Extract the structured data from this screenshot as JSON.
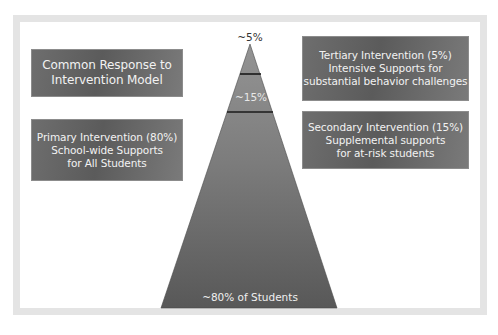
{
  "diagram": {
    "title_box": {
      "lines": [
        "Common Response to",
        "Intervention Model"
      ]
    },
    "primary_box": {
      "lines": [
        "Primary Intervention (80%)",
        "School-wide Supports",
        "for All Students"
      ]
    },
    "tertiary_box": {
      "lines": [
        "Tertiary Intervention (5%)",
        "Intensive Supports for",
        "substantial behavior challenges"
      ]
    },
    "secondary_box": {
      "lines": [
        "Secondary Intervention (15%)",
        "Supplemental supports",
        "for at-risk students"
      ]
    },
    "pyramid": {
      "tiers": [
        {
          "label": "~5%",
          "position": "top"
        },
        {
          "label": "~15%",
          "position": "middle"
        },
        {
          "label": "~80% of Students",
          "position": "base"
        }
      ]
    },
    "colors": {
      "box_fill": "#666666",
      "box_text": "#f2f2f2",
      "pyramid_top": "#8e8e8e",
      "pyramid_bottom": "#5a5a5a",
      "frame_border": "#e4e4e4",
      "divider": "#1a1a1a"
    }
  }
}
